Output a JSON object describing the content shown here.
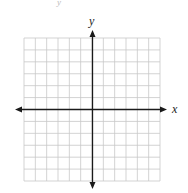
{
  "diagram": {
    "type": "coordinate-plane",
    "grid": {
      "columns": 12,
      "rows": 12,
      "color": "#c8c8c8"
    },
    "axes": {
      "color": "#1a1a1a",
      "x_label": "x",
      "y_label": "y",
      "arrows": "both-ends"
    },
    "top_fragment": "y"
  }
}
